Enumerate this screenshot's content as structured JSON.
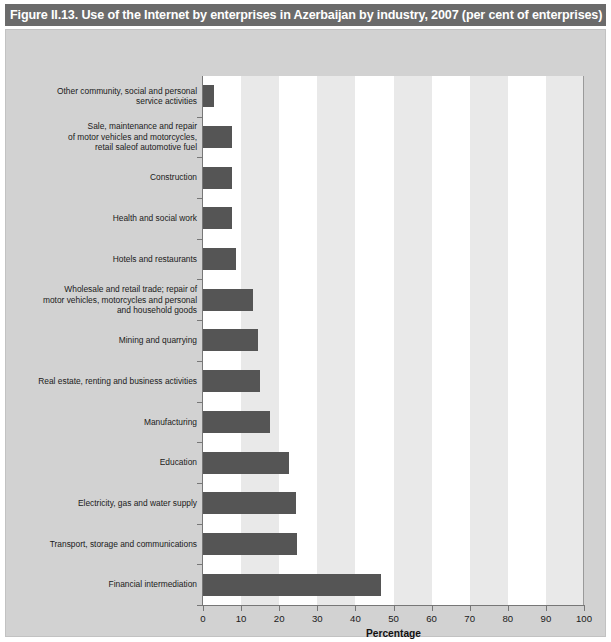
{
  "figure": {
    "title": "Figure II.13. Use of the Internet by enterprises in Azerbaijan by industry, 2007 (per cent of enterprises)",
    "title_bar_color": "#6b6b6b",
    "panel_color": "#d2d2d2",
    "bar_color": "#555555",
    "band_color": "#e9e9e9"
  },
  "chart_data": {
    "type": "bar",
    "orientation": "horizontal",
    "title": "Figure II.13. Use of the Internet by enterprises in Azerbaijan by industry, 2007 (per cent of enterprises)",
    "xlabel": "Percentage",
    "ylabel": "",
    "xlim": [
      0,
      100
    ],
    "xticks": [
      "0",
      "10",
      "20",
      "30",
      "40",
      "50",
      "60",
      "70",
      "80",
      "90",
      "100"
    ],
    "grid": "alternating vertical bands every 10 units",
    "legend": "none",
    "categories": [
      "Other community, social and personal\nservice activities",
      "Sale, maintenance and repair\nof motor vehicles and motorcycles,\nretail saleof automotive fuel",
      "Construction",
      "Health and social work",
      "Hotels and restaurants",
      "Wholesale and retail trade; repair of\nmotor vehicles, motorcycles and personal\nand household goods",
      "Mining and quarrying",
      "Real estate, renting and business activities",
      "Manufacturing",
      "Education",
      "Electricity, gas and water supply",
      "Transport, storage and communications",
      "Financial intermediation"
    ],
    "values": [
      3.0,
      7.5,
      7.6,
      7.7,
      8.7,
      13.0,
      14.5,
      15.0,
      17.5,
      22.5,
      24.5,
      24.6,
      46.7
    ]
  }
}
